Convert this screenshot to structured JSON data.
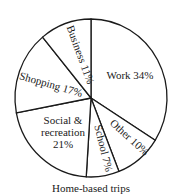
{
  "chart_data": {
    "type": "pie",
    "title": "",
    "caption": "Home-based trips",
    "start_angle_deg": -90,
    "direction": "clockwise",
    "slices": [
      {
        "label": "Work",
        "value": 34,
        "text": "Work 34%"
      },
      {
        "label": "Other",
        "value": 10,
        "text": "Other 10%"
      },
      {
        "label": "School",
        "value": 7,
        "text": "School 7%"
      },
      {
        "label": "Social & recreation",
        "value": 21,
        "text_lines": [
          "Social &",
          "recreation",
          "21%"
        ]
      },
      {
        "label": "Shopping",
        "value": 17,
        "text": "Shopping 17%"
      },
      {
        "label": "Business",
        "value": 11,
        "text": "Business 11%"
      }
    ],
    "colors": {
      "fill": "#ffffff",
      "stroke": "#1a1a1a"
    }
  }
}
